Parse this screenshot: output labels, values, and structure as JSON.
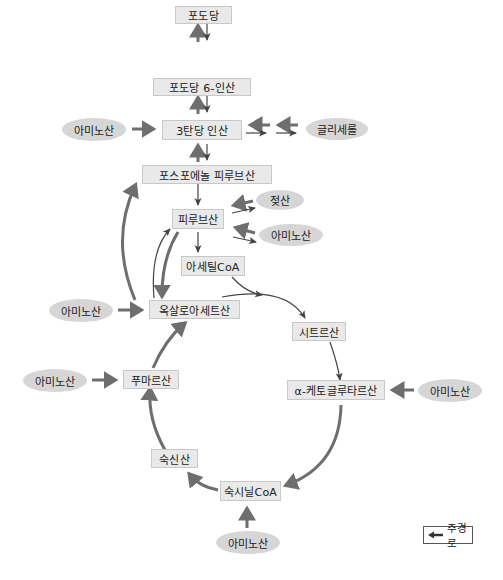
{
  "diagram": {
    "colors": {
      "box_fill": "#e9e9e9",
      "box_border": "#c8c8c8",
      "oval_fill": "#d6d6d6",
      "main_arrow": "#6e6e6e",
      "thin_arrow": "#444444"
    },
    "nodes": {
      "glucose": "포도당",
      "glucose_6p": "포도당 6-인산",
      "triose_p": "3탄당 인산",
      "pep": "포스포에놀 피루브산",
      "pyruvate": "피루브산",
      "acetyl_coa": "아세틸CoA",
      "oxaloacetate": "옥살로아세트산",
      "citrate": "시트르산",
      "a_ketoglutarate": "α-케토글루타르산",
      "succinyl_coa": "숙시닐CoA",
      "succinate": "숙신산",
      "fumarate": "푸마르산"
    },
    "inputs": {
      "amino_acid_triose": "아미노산",
      "glycerol": "글리세롤",
      "lactate": "젖산",
      "amino_acid_pyruvate": "아미노산",
      "amino_acid_oxaloacetate": "아미노산",
      "amino_acid_fumarate": "아미노산",
      "amino_acid_ketoglutarate": "아미노산",
      "amino_acid_succinyl": "아미노산"
    },
    "legend": {
      "label": "주경로",
      "icon": "left-arrow-icon"
    }
  }
}
